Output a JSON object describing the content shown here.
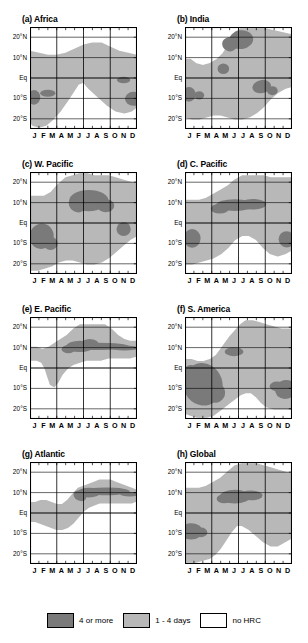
{
  "figure": {
    "y_tick_labels": [
      "20°N",
      "10°N",
      "Eq",
      "10°S",
      "20°S"
    ],
    "y_tick_values": [
      20,
      10,
      0,
      -10,
      -20
    ],
    "x_tick_labels": [
      "J",
      "F",
      "M",
      "A",
      "M",
      "J",
      "J",
      "A",
      "S",
      "O",
      "N",
      "D"
    ]
  },
  "legend": {
    "items": [
      {
        "label": "4 or more",
        "color": "#7a7a7a"
      },
      {
        "label": "1 - 4 days",
        "color": "#b8b8b8"
      },
      {
        "label": "no HRC",
        "color": "#ffffff"
      }
    ]
  },
  "panels": [
    {
      "id": "a",
      "title": "(a) Africa"
    },
    {
      "id": "b",
      "title": "(b) India"
    },
    {
      "id": "c",
      "title": "(c) W. Pacific"
    },
    {
      "id": "d",
      "title": "(d) C. Pacific"
    },
    {
      "id": "e",
      "title": "(e) E. Pacific"
    },
    {
      "id": "f",
      "title": "(f) S. America"
    },
    {
      "id": "g",
      "title": "(g) Atlantic"
    },
    {
      "id": "h",
      "title": "(h) Global"
    }
  ],
  "chart_data": {
    "type": "heatmap",
    "xlabel": "",
    "ylabel": "",
    "xlim": [
      0,
      12
    ],
    "ylim": [
      -25,
      25
    ],
    "grid": true,
    "legend_position": "bottom",
    "x_categories": [
      "J",
      "F",
      "M",
      "A",
      "M",
      "J",
      "J",
      "A",
      "S",
      "O",
      "N",
      "D"
    ],
    "y_ticks": [
      20,
      10,
      0,
      -10,
      -20
    ],
    "y_tick_labels": [
      "20°N",
      "10°N",
      "Eq",
      "10°S",
      "20°S"
    ],
    "levels": [
      {
        "name": "no HRC",
        "range": "0",
        "color": "#ffffff"
      },
      {
        "name": "1 - 4 days",
        "range": "1-4",
        "color": "#b8b8b8"
      },
      {
        "name": "4 or more",
        "range": ">=4",
        "color": "#7a7a7a"
      }
    ],
    "panels": [
      {
        "id": "a",
        "title": "(a) Africa",
        "light_regions": [
          "Broad band from Jan through Dec spanning roughly 15°S to 15°N, peaking near 14°N in Jul-Sep",
          "Southern lobe 5°S to 22°S strongest Dec-Mar"
        ],
        "dark_regions": [
          "Small core near 9°S in Jan",
          "Small core near 8°S in Mar",
          "Small core near 1°S in Nov",
          "Core near 10°S in Dec"
        ]
      },
      {
        "id": "b",
        "title": "(b) India",
        "light_regions": [
          "Wide shading covering most of the domain from 22°S to 24°N, maximum extent Jun-Oct",
          "White wedge in the south Aug-Dec below 10°S"
        ],
        "dark_regions": [
          "Large core 15°N to 22°N, Jun through Aug",
          "Small core near 5°N in May",
          "Core near 3°S to 8°S, Sep-Oct",
          "Core near 8°S in Jan-Feb"
        ]
      },
      {
        "id": "c",
        "title": "(c) W. Pacific",
        "light_regions": [
          "Full-width band covering 22°S to 24°N with maximum northward extent Jun-Oct",
          "Southern extension below the Equator strongest Dec-Apr"
        ],
        "dark_regions": [
          "Elongated core near 8°N to 14°N from Jun through Oct",
          "Core near 5°S to 12°S from Jan through Mar",
          "Small core near 3°S in Nov"
        ]
      },
      {
        "id": "d",
        "title": "(d) C. Pacific",
        "light_regions": [
          "Band across the whole year from 20°S to 24°N with the broadest coverage Jun-Dec",
          "White gap in the south Jul-Oct"
        ],
        "dark_regions": [
          "Narrow core along 6°N to 11°N from Apr through Oct",
          "Core near 8°S in Jan-Feb",
          "Core near 8°S in Nov-Dec"
        ]
      },
      {
        "id": "e",
        "title": "(e) E. Pacific",
        "light_regions": [
          "Band centred near 10°N extending from Jan to Dec, widest Jun-Oct reaching 22°N",
          "Small southward extension near 8°S in Mar-Apr"
        ],
        "dark_regions": [
          "Narrow elongated core along 9°N to 12°N from May through Dec",
          "Slight thickening near 11°N in Jul-Aug"
        ]
      },
      {
        "id": "f",
        "title": "(f) S. America",
        "light_regions": [
          "Large mass from 22°S to 5°N covering Dec through Jun",
          "Northern band near 5°N to 22°N from Apr through Dec",
          "Southeastern extension Oct-Dec"
        ],
        "dark_regions": [
          "Large core from 2°N to 18°S, Jan through Apr",
          "Small core near 8°N in May-Jun",
          "Core near 6°S to 14°S in Nov-Dec"
        ]
      },
      {
        "id": "g",
        "title": "(g) Atlantic",
        "light_regions": [
          "Continuous band near the Equator Jan-Apr widening and moving north Jun-Nov",
          "Maximum northward extent reaching 16°N in Sep-Oct"
        ],
        "dark_regions": [
          "Core along 8°N to 12°N from Jun through Dec, thickest Sep-Oct"
        ]
      },
      {
        "id": "h",
        "title": "(h) Global",
        "light_regions": [
          "Near-complete coverage of the domain, widest Jun-Oct reaching 24°N",
          "Southern lobe 5°S to 24°S strongest Dec-May",
          "White wedge in the south Jul-Nov"
        ],
        "dark_regions": [
          "Core along 5°N to 12°N from Apr through Sep",
          "Core near 6°S to 13°S in Jan-Feb"
        ]
      }
    ]
  }
}
